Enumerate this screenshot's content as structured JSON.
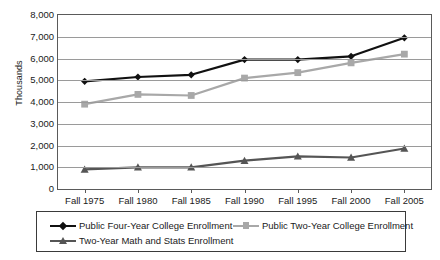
{
  "chart_data": {
    "type": "line",
    "title": "",
    "xlabel": "",
    "ylabel": "Thousands",
    "ylim": [
      0,
      8000
    ],
    "ytick_step": 1000,
    "grid": true,
    "legend_position": "bottom",
    "categories": [
      "Fall 1975",
      "Fall 1980",
      "Fall 1985",
      "Fall 1990",
      "Fall 1995",
      "Fall 2000",
      "Fall 2005"
    ],
    "yticks": [
      "0",
      "1,000",
      "2,000",
      "3,000",
      "4,000",
      "5,000",
      "6,000",
      "7,000",
      "8,000"
    ],
    "ytick_values": [
      0,
      1000,
      2000,
      3000,
      4000,
      5000,
      6000,
      7000,
      8000
    ],
    "series": [
      {
        "name": "Public Four-Year College Enrollment",
        "color": "#111111",
        "marker": "diamond",
        "values": [
          4950,
          5150,
          5250,
          5950,
          5950,
          6100,
          6950
        ]
      },
      {
        "name": "Public Two-Year College Enrollment",
        "color": "#a8a8a8",
        "marker": "square",
        "values": [
          3900,
          4350,
          4300,
          5100,
          5350,
          5800,
          6200
        ]
      },
      {
        "name": "Two-Year Math and Stats Enrollment",
        "color": "#555555",
        "marker": "triangle",
        "values": [
          900,
          1000,
          1000,
          1300,
          1500,
          1450,
          1860
        ]
      }
    ]
  },
  "legend": {
    "items": [
      {
        "label": "Public Four-Year College Enrollment"
      },
      {
        "label": "Public Two-Year College Enrollment"
      },
      {
        "label": "Two-Year Math and Stats Enrollment"
      }
    ]
  }
}
